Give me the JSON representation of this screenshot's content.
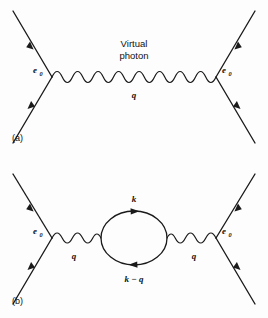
{
  "figure": {
    "background_color": "#fdfdfd",
    "line_color": "#1a1a1a",
    "width": 268,
    "height": 318
  },
  "panels": [
    {
      "id": "a",
      "panel_label": "(a)",
      "description": "Lowest-order electron-electron scattering via single virtual photon exchange",
      "labels": {
        "vertex_left": "e",
        "vertex_left_sub": "0",
        "vertex_right": "e",
        "vertex_right_sub": "0",
        "propagator_title_line1": "Virtual",
        "propagator_title_line2": "photon",
        "momentum": "q"
      }
    },
    {
      "id": "b",
      "panel_label": "(b)",
      "description": "Vacuum polarization correction: photon propagator with fermion loop",
      "labels": {
        "vertex_left": "e",
        "vertex_left_sub": "0",
        "vertex_right": "e",
        "vertex_right_sub": "0",
        "momentum_left": "q",
        "momentum_right": "q",
        "loop_top": "k",
        "loop_bottom": "k − q"
      }
    }
  ]
}
